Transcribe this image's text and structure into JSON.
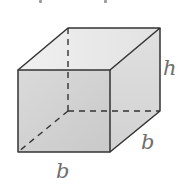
{
  "figure": {
    "type": "cube",
    "labels": {
      "height": "h",
      "depth": "b",
      "width": "b"
    },
    "colors": {
      "edge": "#333333",
      "top_face": "#ebebeb",
      "front_face": "#d2d2d2",
      "right_face": "#dadada",
      "label": "#6e6e6e"
    }
  }
}
